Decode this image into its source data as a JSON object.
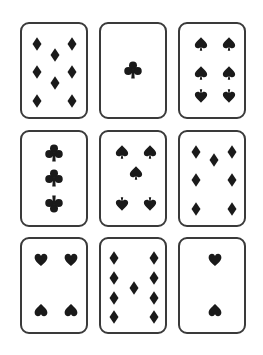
{
  "layout": {
    "card_width": 64,
    "card_height": 93,
    "border_color": "#3a3a3a",
    "pip_color": "#1a1a1a",
    "background": "#ffffff"
  },
  "cards": [
    {
      "id": "eight-of-diamonds",
      "rank": "8",
      "suit": "diamonds",
      "x": 20,
      "y": 22,
      "pips": [
        {
          "x": 15,
          "y": 20
        },
        {
          "x": 50,
          "y": 20
        },
        {
          "x": 33,
          "y": 31
        },
        {
          "x": 15,
          "y": 48
        },
        {
          "x": 50,
          "y": 48
        },
        {
          "x": 33,
          "y": 59
        },
        {
          "x": 15,
          "y": 77
        },
        {
          "x": 50,
          "y": 77
        }
      ]
    },
    {
      "id": "ace-of-clubs",
      "rank": "A",
      "suit": "clubs",
      "x": 99,
      "y": 22,
      "pips": [
        {
          "x": 32,
          "y": 46,
          "big": true
        }
      ]
    },
    {
      "id": "six-of-spades",
      "rank": "6",
      "suit": "spades",
      "x": 178,
      "y": 22,
      "pips": [
        {
          "x": 21,
          "y": 20
        },
        {
          "x": 49,
          "y": 20
        },
        {
          "x": 21,
          "y": 49
        },
        {
          "x": 49,
          "y": 49
        },
        {
          "x": 21,
          "y": 72,
          "flip": true
        },
        {
          "x": 49,
          "y": 72,
          "flip": true
        }
      ]
    },
    {
      "id": "three-of-clubs",
      "rank": "3",
      "suit": "clubs",
      "x": 20,
      "y": 130,
      "pips": [
        {
          "x": 32,
          "y": 21,
          "big": true
        },
        {
          "x": 32,
          "y": 46,
          "big": true
        },
        {
          "x": 32,
          "y": 72,
          "big": true,
          "flip": true
        }
      ]
    },
    {
      "id": "five-of-spades",
      "rank": "5",
      "suit": "spades",
      "x": 99,
      "y": 130,
      "pips": [
        {
          "x": 21,
          "y": 20
        },
        {
          "x": 49,
          "y": 20
        },
        {
          "x": 35,
          "y": 41
        },
        {
          "x": 21,
          "y": 72,
          "flip": true
        },
        {
          "x": 49,
          "y": 72,
          "flip": true
        }
      ]
    },
    {
      "id": "seven-of-diamonds",
      "rank": "7",
      "suit": "diamonds",
      "x": 178,
      "y": 130,
      "pips": [
        {
          "x": 16,
          "y": 20
        },
        {
          "x": 52,
          "y": 20
        },
        {
          "x": 34,
          "y": 28
        },
        {
          "x": 16,
          "y": 48
        },
        {
          "x": 52,
          "y": 48
        },
        {
          "x": 16,
          "y": 77
        },
        {
          "x": 52,
          "y": 77
        }
      ]
    },
    {
      "id": "four-of-hearts",
      "rank": "4",
      "suit": "hearts",
      "x": 20,
      "y": 237,
      "pips": [
        {
          "x": 19,
          "y": 21
        },
        {
          "x": 49,
          "y": 21
        },
        {
          "x": 19,
          "y": 71,
          "flip": true
        },
        {
          "x": 49,
          "y": 71,
          "flip": true
        }
      ]
    },
    {
      "id": "nine-of-diamonds",
      "rank": "9",
      "suit": "diamonds",
      "x": 99,
      "y": 237,
      "pips": [
        {
          "x": 13,
          "y": 19
        },
        {
          "x": 53,
          "y": 19
        },
        {
          "x": 13,
          "y": 39
        },
        {
          "x": 53,
          "y": 39
        },
        {
          "x": 33,
          "y": 49
        },
        {
          "x": 13,
          "y": 59
        },
        {
          "x": 53,
          "y": 59
        },
        {
          "x": 13,
          "y": 78
        },
        {
          "x": 53,
          "y": 78
        }
      ]
    },
    {
      "id": "two-of-hearts",
      "rank": "2",
      "suit": "hearts",
      "x": 178,
      "y": 237,
      "pips": [
        {
          "x": 35,
          "y": 21
        },
        {
          "x": 35,
          "y": 71,
          "flip": true
        }
      ]
    }
  ]
}
